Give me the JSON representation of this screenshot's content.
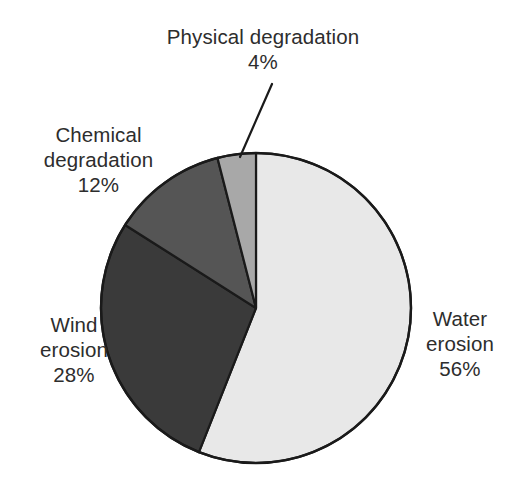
{
  "chart_data": {
    "type": "pie",
    "title": "",
    "subtitle": "",
    "xlabel": "",
    "ylabel": "",
    "legend_position": "none",
    "grid": false,
    "start_angle_deg": 0,
    "direction": "clockwise",
    "categories": [
      "Water erosion",
      "Wind erosion",
      "Chemical degradation",
      "Physical degradation"
    ],
    "values": [
      56,
      28,
      12,
      4
    ],
    "value_unit": "%",
    "total": 100,
    "slices": [
      {
        "name": "Water erosion",
        "label_line1": "Water",
        "label_line2": "erosion",
        "value": 56,
        "value_text": "56%",
        "color": "#e8e8e8",
        "stroke": "#1a1a1a",
        "start_deg": 0,
        "end_deg": 201.6,
        "label_position": "right",
        "has_leader_line": false
      },
      {
        "name": "Wind erosion",
        "label_line1": "Wind",
        "label_line2": "erosion",
        "value": 28,
        "value_text": "28%",
        "color": "#3a3a3a",
        "stroke": "#1a1a1a",
        "start_deg": 201.6,
        "end_deg": 302.4,
        "label_position": "left-lower",
        "has_leader_line": false
      },
      {
        "name": "Chemical degradation",
        "label_line1": "Chemical",
        "label_line2": "degradation",
        "value": 12,
        "value_text": "12%",
        "color": "#555555",
        "stroke": "#1a1a1a",
        "start_deg": 302.4,
        "end_deg": 345.6,
        "label_position": "left-upper",
        "has_leader_line": false
      },
      {
        "name": "Physical degradation",
        "label_line1": "Physical degradation",
        "label_line2": "",
        "value": 4,
        "value_text": "4%",
        "color": "#a8a8a8",
        "stroke": "#1a1a1a",
        "start_deg": 345.6,
        "end_deg": 360,
        "label_position": "top",
        "has_leader_line": true
      }
    ]
  },
  "labels": {
    "physical_degradation": "Physical degradation\n4%",
    "chemical_degradation": "Chemical\ndegradation\n12%",
    "wind_erosion": "Wind\nerosion\n28%",
    "water_erosion": "Water\nerosion\n56%"
  },
  "colors": {
    "background": "#ffffff",
    "text": "#2d2d2d",
    "outline": "#1a1a1a",
    "water_erosion": "#e8e8e8",
    "wind_erosion": "#3a3a3a",
    "chemical_degradation": "#555555",
    "physical_degradation": "#a8a8a8"
  }
}
